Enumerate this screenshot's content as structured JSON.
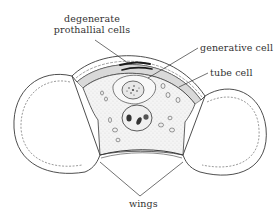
{
  "diagram": {
    "labels": {
      "degenerate_line1": "degenerate",
      "degenerate_line2": "prothallial cells",
      "generative_cell": "generative cell",
      "tube_cell": "tube cell",
      "wings": "wings"
    },
    "colors": {
      "line": "#3a3a3a",
      "wall_band": "#d9d9d9",
      "cytoplasm": "#f3f3f3",
      "background": "#ffffff",
      "text": "#333333"
    }
  }
}
